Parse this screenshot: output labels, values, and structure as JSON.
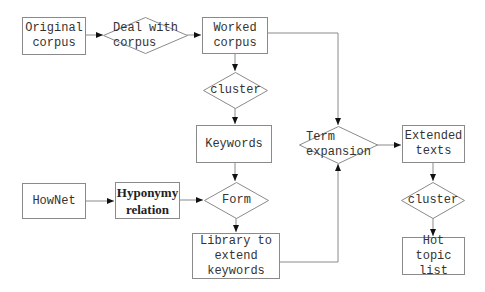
{
  "diagram": {
    "type": "flowchart",
    "line_color": "#8a8a8a",
    "text_color": "#333333",
    "nodes": {
      "original_corpus": {
        "label": "Original\ncorpus",
        "shape": "box"
      },
      "deal_with_corpus": {
        "label": "Deal with\ncorpus",
        "shape": "diamond"
      },
      "worked_corpus": {
        "label": "Worked\ncorpus",
        "shape": "box"
      },
      "cluster_1": {
        "label": "cluster",
        "shape": "diamond"
      },
      "keywords": {
        "label": "Keywords",
        "shape": "box"
      },
      "hownet": {
        "label": "HowNet",
        "shape": "box"
      },
      "hyponymy_relation": {
        "label": "Hyponymy\nrelation",
        "shape": "box"
      },
      "form": {
        "label": "Form",
        "shape": "diamond"
      },
      "library": {
        "label": "Library to\nextend\nkeywords",
        "shape": "box"
      },
      "term_expansion": {
        "label": "Term\nexpansion",
        "shape": "diamond"
      },
      "extended_texts": {
        "label": "Extended\ntexts",
        "shape": "box"
      },
      "cluster_2": {
        "label": "cluster",
        "shape": "diamond"
      },
      "hot_topic_list": {
        "label": "Hot topic\nlist",
        "shape": "box"
      }
    },
    "edges": [
      {
        "from": "Original corpus",
        "to": "Deal with corpus"
      },
      {
        "from": "Deal with corpus",
        "to": "Worked corpus"
      },
      {
        "from": "Worked corpus",
        "to": "cluster"
      },
      {
        "from": "Worked corpus",
        "to": "Term expansion"
      },
      {
        "from": "cluster",
        "to": "Keywords"
      },
      {
        "from": "Keywords",
        "to": "Form"
      },
      {
        "from": "HowNet",
        "to": "Hyponymy relation"
      },
      {
        "from": "Hyponymy relation",
        "to": "Form"
      },
      {
        "from": "Form",
        "to": "Library to extend keywords"
      },
      {
        "from": "Library to extend keywords",
        "to": "Term expansion"
      },
      {
        "from": "Term expansion",
        "to": "Extended texts"
      },
      {
        "from": "Extended texts",
        "to": "cluster"
      },
      {
        "from": "cluster",
        "to": "Hot topic list"
      }
    ]
  }
}
